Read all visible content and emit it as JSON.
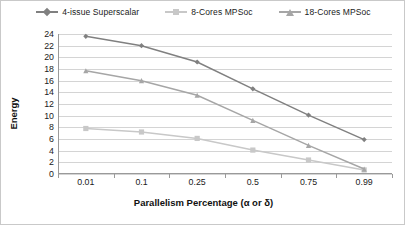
{
  "chart_data": {
    "type": "line",
    "title": "",
    "xlabel": "Parallelism Percentage (α or δ)",
    "ylabel": "Energy",
    "categories": [
      "0.01",
      "0.1",
      "0.25",
      "0.5",
      "0.75",
      "0.99"
    ],
    "ylim": [
      0,
      24
    ],
    "ytick_step": 2,
    "yticks": [
      24,
      22,
      20,
      18,
      16,
      14,
      12,
      10,
      8,
      6,
      4,
      2,
      0
    ],
    "grid": "horizontal",
    "legend_position": "top-center",
    "series": [
      {
        "name": "4-issue Superscalar",
        "color": "#808080",
        "marker": "diamond",
        "values": [
          23.6,
          22.0,
          19.2,
          14.6,
          10.1,
          5.9
        ]
      },
      {
        "name": "8-Cores MPSoc",
        "color": "#c8c8c8",
        "marker": "square",
        "values": [
          7.8,
          7.2,
          6.1,
          4.1,
          2.4,
          0.7
        ]
      },
      {
        "name": "18-Cores MPSoc",
        "color": "#a6a6a6",
        "marker": "triangle",
        "values": [
          17.7,
          16.0,
          13.5,
          9.2,
          4.9,
          0.85
        ]
      }
    ]
  }
}
